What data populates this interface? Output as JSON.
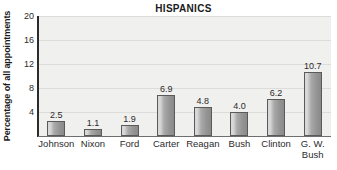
{
  "chart_data": {
    "type": "bar",
    "title": "HISPANICS",
    "xlabel": "",
    "ylabel": "Percentage of all appointments",
    "categories": [
      "Johnson",
      "Nixon",
      "Ford",
      "Carter",
      "Reagan",
      "Bush",
      "Clinton",
      "G. W. Bush"
    ],
    "category_lines": [
      [
        "Johnson"
      ],
      [
        "Nixon"
      ],
      [
        "Ford"
      ],
      [
        "Carter"
      ],
      [
        "Reagan"
      ],
      [
        "Bush"
      ],
      [
        "Clinton"
      ],
      [
        "G. W.",
        "Bush"
      ]
    ],
    "values": [
      2.5,
      1.1,
      1.9,
      6.9,
      4.8,
      4.0,
      6.2,
      10.7
    ],
    "value_labels": [
      "2.5",
      "1.1",
      "1.9",
      "6.9",
      "4.8",
      "4.0",
      "6.2",
      "10.7"
    ],
    "ylim": [
      0,
      20
    ],
    "yticks": [
      4,
      8,
      12,
      16,
      20
    ],
    "ytick_labels": [
      "4",
      "8",
      "12",
      "16",
      "20"
    ],
    "grid": true,
    "legend": null,
    "colors": {
      "bar_light": "#d8d8d8",
      "bar_mid": "#a9a9a9",
      "bar_dark": "#8a8a8a",
      "bar_border": "#5a5a5a",
      "plot_background": "#f0f0ef",
      "gridline": "#dcdcda",
      "axis": "#2b2b2b",
      "text": "#2b2b2b",
      "page_background": "#ffffff"
    }
  }
}
